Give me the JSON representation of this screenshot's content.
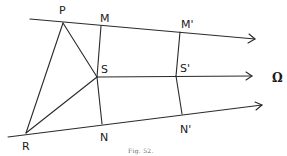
{
  "figure": {
    "caption": "Fig. 52.",
    "limit_label": "Ω"
  },
  "points": {
    "P": {
      "label": "P",
      "x": 63,
      "y": 23
    },
    "M": {
      "label": "M",
      "x": 101,
      "y": 26
    },
    "M_prime": {
      "label": "M'",
      "x": 180,
      "y": 32
    },
    "S": {
      "label": "S",
      "x": 97,
      "y": 77
    },
    "S_prime": {
      "label": "S'",
      "x": 176,
      "y": 76
    },
    "R": {
      "label": "R",
      "x": 26,
      "y": 133
    },
    "N": {
      "label": "N",
      "x": 102,
      "y": 124
    },
    "N_prime": {
      "label": "N'",
      "x": 182,
      "y": 114
    }
  },
  "lines": [
    {
      "name": "top-ray",
      "from": [
        30,
        19
      ],
      "to": [
        255,
        39
      ],
      "arrow": true
    },
    {
      "name": "middle-ray",
      "from": [
        97,
        77
      ],
      "to": [
        252,
        76
      ],
      "arrow": true
    },
    {
      "name": "bottom-ray",
      "from": [
        8,
        137
      ],
      "to": [
        262,
        105
      ],
      "arrow": true
    },
    {
      "name": "PR",
      "from": "P",
      "to": "R"
    },
    {
      "name": "PS",
      "from": "P",
      "to": "S"
    },
    {
      "name": "RS",
      "from": "R",
      "to": "S"
    },
    {
      "name": "MSN",
      "from": "M",
      "to": "N",
      "through": "S"
    },
    {
      "name": "M'S'N'",
      "from": "M_prime",
      "to": "N_prime",
      "through": "S_prime"
    }
  ]
}
